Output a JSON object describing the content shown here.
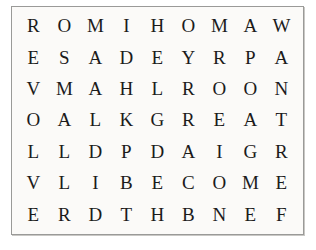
{
  "puzzle": {
    "type": "word-search",
    "rows": 7,
    "columns": 9,
    "background_color": "#fbfaf8",
    "border_color": "#9a9a98",
    "letter_color": "#1b1b1b",
    "grid": [
      [
        "R",
        "O",
        "M",
        "I",
        "H",
        "O",
        "M",
        "A",
        "W"
      ],
      [
        "E",
        "S",
        "A",
        "D",
        "E",
        "Y",
        "R",
        "P",
        "A"
      ],
      [
        "V",
        "M",
        "A",
        "H",
        "L",
        "R",
        "O",
        "O",
        "N"
      ],
      [
        "O",
        "A",
        "L",
        "K",
        "G",
        "R",
        "E",
        "A",
        "T"
      ],
      [
        "L",
        "L",
        "D",
        "P",
        "D",
        "A",
        "I",
        "G",
        "R"
      ],
      [
        "V",
        "L",
        "I",
        "B",
        "E",
        "C",
        "O",
        "M",
        "E"
      ],
      [
        "E",
        "R",
        "D",
        "T",
        "H",
        "B",
        "N",
        "E",
        "F"
      ]
    ]
  }
}
